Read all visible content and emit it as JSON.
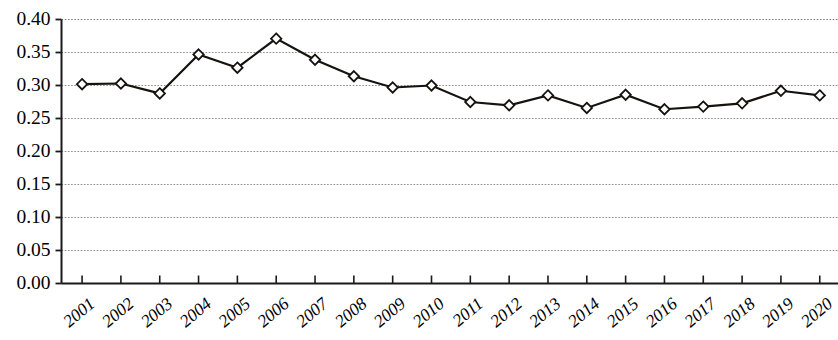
{
  "chart_data": {
    "type": "line",
    "title": "",
    "subtitle": "",
    "xlabel": "",
    "ylabel": "",
    "categories": [
      "2001",
      "2002",
      "2003",
      "2004",
      "2005",
      "2006",
      "2007",
      "2008",
      "2009",
      "2010",
      "2011",
      "2012",
      "2013",
      "2014",
      "2015",
      "2016",
      "2017",
      "2018",
      "2019",
      "2020"
    ],
    "values": [
      0.302,
      0.303,
      0.288,
      0.347,
      0.327,
      0.371,
      0.339,
      0.314,
      0.297,
      0.3,
      0.275,
      0.27,
      0.285,
      0.266,
      0.286,
      0.264,
      0.268,
      0.273,
      0.292,
      0.285
    ],
    "series": [
      {
        "name": "",
        "values": [
          0.302,
          0.303,
          0.288,
          0.347,
          0.327,
          0.371,
          0.339,
          0.314,
          0.297,
          0.3,
          0.275,
          0.27,
          0.285,
          0.266,
          0.286,
          0.264,
          0.268,
          0.273,
          0.292,
          0.285
        ]
      }
    ],
    "ylim": [
      0.0,
      0.4
    ],
    "ytick_labels": [
      "0.00",
      "0.05",
      "0.10",
      "0.15",
      "0.20",
      "0.25",
      "0.30",
      "0.35",
      "0.40"
    ],
    "ytick_values": [
      0.0,
      0.05,
      0.1,
      0.15,
      0.2,
      0.25,
      0.3,
      0.35,
      0.4
    ],
    "grid": true,
    "grid_axis": "y",
    "legend": false,
    "legend_position": "none",
    "marker": "diamond",
    "marker_fill": "#ffffff",
    "line_color": "#16130f",
    "grid_color": "#8a8a8a",
    "axis_color": "#1a1a1a",
    "xtick_rotation": -40,
    "annotations": []
  }
}
